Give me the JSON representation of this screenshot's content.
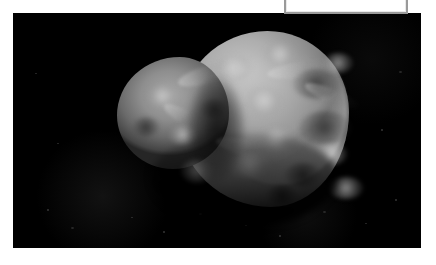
{
  "page": {
    "background_color": "#ffffff",
    "width": 436,
    "height": 265
  },
  "annotation": {
    "name": "bracket-annotation",
    "shape": "rectangle-outline",
    "stroke_color": "#9a9a9a",
    "inner_stroke_color": "#e9e9e9",
    "clipped": "top",
    "left": 284,
    "top": -22,
    "width": 124,
    "height": 36,
    "label": ""
  },
  "photo": {
    "name": "comet-nucleus-photo",
    "background_color": "#000000",
    "left": 13,
    "top": 13,
    "width": 408,
    "height": 235,
    "subject": "comet-nucleus",
    "caption": "",
    "alt": "Grayscale spacecraft image of an irregular, bilobed comet nucleus against a black starfield"
  },
  "nucleus": {
    "name": "nucleus-body",
    "description": "Irregular bilobed icy body with a large rounded right lobe and a smaller left lobe joined by a shadowed neck",
    "highlight_color": "#b8b8b8",
    "midtone_color": "#7a7a7a",
    "shadow_color": "#2d2d2d",
    "left": 104,
    "top": 12,
    "width": 232,
    "height": 192
  },
  "specks": [
    {
      "left": 34,
      "top": 196,
      "size": "s1"
    },
    {
      "left": 58,
      "top": 214,
      "size": "s2"
    },
    {
      "left": 118,
      "top": 204,
      "size": "s3"
    },
    {
      "left": 150,
      "top": 218,
      "size": "s1"
    },
    {
      "left": 186,
      "top": 200,
      "size": "s2"
    },
    {
      "left": 232,
      "top": 212,
      "size": "s3"
    },
    {
      "left": 266,
      "top": 222,
      "size": "s1"
    },
    {
      "left": 310,
      "top": 198,
      "size": "s2"
    },
    {
      "left": 352,
      "top": 210,
      "size": "s3"
    },
    {
      "left": 382,
      "top": 186,
      "size": "s1"
    },
    {
      "left": 22,
      "top": 60,
      "size": "s3"
    },
    {
      "left": 386,
      "top": 58,
      "size": "s2"
    },
    {
      "left": 368,
      "top": 116,
      "size": "s1"
    },
    {
      "left": 44,
      "top": 130,
      "size": "s3"
    }
  ],
  "craters": [
    {
      "left": 96,
      "top": 30,
      "w": 40,
      "h": 26,
      "tone": "bright"
    },
    {
      "left": 146,
      "top": 18,
      "w": 34,
      "h": 22,
      "tone": "bright"
    },
    {
      "left": 176,
      "top": 44,
      "w": 46,
      "h": 30,
      "tone": "dark"
    },
    {
      "left": 128,
      "top": 62,
      "w": 38,
      "h": 28,
      "tone": "bright"
    },
    {
      "left": 182,
      "top": 86,
      "w": 52,
      "h": 34,
      "tone": "dark"
    },
    {
      "left": 142,
      "top": 102,
      "w": 34,
      "h": 24,
      "tone": "bright"
    },
    {
      "left": 206,
      "top": 28,
      "w": 30,
      "h": 20,
      "tone": "bright"
    },
    {
      "left": 84,
      "top": 74,
      "w": 26,
      "h": 20,
      "tone": "dark"
    },
    {
      "left": 30,
      "top": 60,
      "w": 30,
      "h": 22,
      "tone": "bright"
    },
    {
      "left": 16,
      "top": 92,
      "w": 26,
      "h": 20,
      "tone": "dark"
    },
    {
      "left": 52,
      "top": 100,
      "w": 28,
      "h": 20,
      "tone": "bright"
    },
    {
      "left": 112,
      "top": 128,
      "w": 42,
      "h": 26,
      "tone": "bright"
    },
    {
      "left": 168,
      "top": 138,
      "w": 36,
      "h": 24,
      "tone": "dark"
    },
    {
      "left": 200,
      "top": 118,
      "w": 30,
      "h": 22,
      "tone": "bright"
    },
    {
      "left": 64,
      "top": 134,
      "w": 32,
      "h": 24,
      "tone": "bright"
    },
    {
      "left": 212,
      "top": 152,
      "w": 34,
      "h": 22,
      "tone": "bright"
    },
    {
      "left": 150,
      "top": 160,
      "w": 30,
      "h": 20,
      "tone": "dark"
    }
  ],
  "ridges": [
    {
      "left": 60,
      "top": 40,
      "w": 66,
      "h": 18,
      "rot": -16
    },
    {
      "left": 150,
      "top": 36,
      "w": 78,
      "h": 16,
      "rot": -8
    },
    {
      "left": 98,
      "top": 116,
      "w": 70,
      "h": 16,
      "rot": 14
    },
    {
      "left": 186,
      "top": 64,
      "w": 58,
      "h": 14,
      "rot": 22
    },
    {
      "left": 44,
      "top": 86,
      "w": 50,
      "h": 14,
      "rot": 30
    }
  ]
}
